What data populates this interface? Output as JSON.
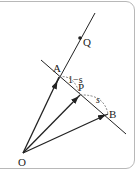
{
  "diagram": {
    "type": "vector-geometry",
    "points": {
      "O": {
        "label": "O",
        "x": 23,
        "y": 153
      },
      "A": {
        "label": "A",
        "x": 59,
        "y": 77
      },
      "P": {
        "label": "P",
        "x": 80,
        "y": 95
      },
      "B": {
        "label": "B",
        "x": 108,
        "y": 114
      },
      "Q": {
        "label": "Q",
        "x": 80,
        "y": 38
      }
    },
    "segment_labels": {
      "AP": "1−s",
      "PB": "s"
    },
    "colors": {
      "line": "#222222",
      "dashed": "#666666",
      "border": "#b8b8b8"
    }
  }
}
